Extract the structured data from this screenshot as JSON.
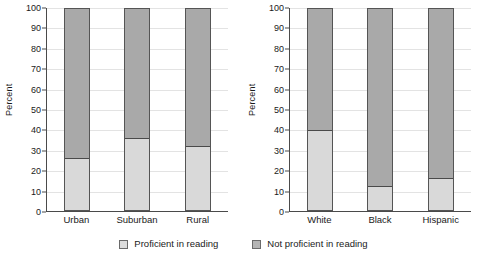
{
  "chart_data": [
    {
      "type": "bar",
      "title": "",
      "xlabel": "",
      "ylabel": "Percent",
      "ylim": [
        0,
        100
      ],
      "ytick_step": 10,
      "yticks": [
        100,
        90,
        80,
        70,
        60,
        50,
        40,
        30,
        20,
        10,
        0
      ],
      "grid": true,
      "stacked": true,
      "legend_position": "bottom",
      "categories": [
        "Urban",
        "Suburban",
        "Rural"
      ],
      "series": [
        {
          "name": "Proficient in reading",
          "values": [
            26,
            36,
            32
          ],
          "color": "#d9d9d9"
        },
        {
          "name": "Not proficient in reading",
          "values": [
            74,
            64,
            68
          ],
          "color": "#a9a9a9"
        }
      ]
    },
    {
      "type": "bar",
      "title": "",
      "xlabel": "",
      "ylabel": "Percent",
      "ylim": [
        0,
        100
      ],
      "ytick_step": 10,
      "yticks": [
        100,
        90,
        80,
        70,
        60,
        50,
        40,
        30,
        20,
        10,
        0
      ],
      "grid": true,
      "stacked": true,
      "legend_position": "bottom",
      "categories": [
        "White",
        "Black",
        "Hispanic"
      ],
      "series": [
        {
          "name": "Proficient in reading",
          "values": [
            40,
            12,
            16
          ],
          "color": "#d9d9d9"
        },
        {
          "name": "Not proficient in reading",
          "values": [
            60,
            88,
            84
          ],
          "color": "#a9a9a9"
        }
      ]
    }
  ],
  "panels": [
    {
      "ylabel": "Percent",
      "yticks": [
        "100",
        "90",
        "80",
        "70",
        "60",
        "50",
        "40",
        "30",
        "20",
        "10",
        "0"
      ],
      "bars": [
        {
          "label": "Urban",
          "proficient": 26
        },
        {
          "label": "Suburban",
          "proficient": 36
        },
        {
          "label": "Rural",
          "proficient": 32
        }
      ]
    },
    {
      "ylabel": "Percent",
      "yticks": [
        "100",
        "90",
        "80",
        "70",
        "60",
        "50",
        "40",
        "30",
        "20",
        "10",
        "0"
      ],
      "bars": [
        {
          "label": "White",
          "proficient": 40
        },
        {
          "label": "Black",
          "proficient": 12
        },
        {
          "label": "Hispanic",
          "proficient": 16
        }
      ]
    }
  ],
  "legend": {
    "items": [
      {
        "label": "Proficient in reading",
        "color": "#d9d9d9"
      },
      {
        "label": "Not proficient in reading",
        "color": "#a9a9a9"
      }
    ]
  }
}
